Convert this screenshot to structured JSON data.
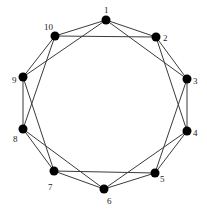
{
  "diagram": {
    "type": "graph",
    "colors": {
      "edge": "#3a3a3a",
      "node": "#000000",
      "label": "#222222"
    },
    "nodes": [
      {
        "id": 1,
        "label": "1",
        "x": 106,
        "y": 20,
        "lx": 104,
        "ly": 13
      },
      {
        "id": 2,
        "label": "2",
        "x": 156,
        "y": 37,
        "lx": 163,
        "ly": 41
      },
      {
        "id": 3,
        "label": "3",
        "x": 187,
        "y": 79,
        "lx": 193,
        "ly": 84
      },
      {
        "id": 4,
        "label": "4",
        "x": 187,
        "y": 131,
        "lx": 193,
        "ly": 136
      },
      {
        "id": 5,
        "label": "5",
        "x": 155,
        "y": 173,
        "lx": 160,
        "ly": 182
      },
      {
        "id": 6,
        "label": "6",
        "x": 104,
        "y": 189,
        "lx": 107,
        "ly": 204
      },
      {
        "id": 7,
        "label": "7",
        "x": 54,
        "y": 171,
        "lx": 48,
        "ly": 190
      },
      {
        "id": 8,
        "label": "8",
        "x": 23,
        "y": 129,
        "lx": 13,
        "ly": 142
      },
      {
        "id": 9,
        "label": "9",
        "x": 23,
        "y": 77,
        "lx": 12,
        "ly": 83
      },
      {
        "id": 10,
        "label": "10",
        "x": 55,
        "y": 36,
        "lx": 44,
        "ly": 30
      }
    ],
    "edges": [
      [
        1,
        2
      ],
      [
        1,
        3
      ],
      [
        1,
        9
      ],
      [
        1,
        10
      ],
      [
        2,
        3
      ],
      [
        2,
        4
      ],
      [
        2,
        10
      ],
      [
        3,
        4
      ],
      [
        3,
        5
      ],
      [
        4,
        5
      ],
      [
        4,
        6
      ],
      [
        5,
        6
      ],
      [
        5,
        7
      ],
      [
        6,
        7
      ],
      [
        6,
        8
      ],
      [
        7,
        8
      ],
      [
        7,
        9
      ],
      [
        8,
        9
      ],
      [
        8,
        10
      ],
      [
        9,
        10
      ]
    ]
  }
}
